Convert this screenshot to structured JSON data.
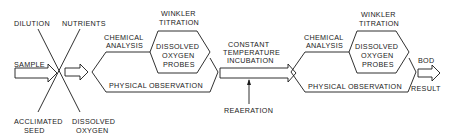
{
  "diagram": {
    "inputs": {
      "top_left": "DILUTION",
      "top_right": "NUTRIENTS",
      "left": "SAMPLE",
      "bottom_left": [
        "ACCLIMATED",
        "SEED"
      ],
      "bottom_right": [
        "DISSOLVED",
        "OXYGEN"
      ]
    },
    "stage1": {
      "chemical_analysis": [
        "CHEMICAL",
        "ANALYSIS"
      ],
      "winkler": [
        "WINKLER",
        "TITRATION"
      ],
      "do_probes": [
        "DISSOLVED",
        "OXYGEN",
        "PROBES"
      ],
      "physical_observation": "PHYSICAL OBSERVATION"
    },
    "incubation": {
      "label": [
        "CONSTANT",
        "TEMPERATURE",
        "INCUBATION"
      ],
      "reaeration": "REAERATION"
    },
    "stage2": {
      "chemical_analysis": [
        "CHEMICAL",
        "ANALYSIS"
      ],
      "winkler": [
        "WINKLER",
        "TITRATION"
      ],
      "do_probes": [
        "DISSOLVED",
        "OXYGEN",
        "PROBES"
      ],
      "physical_observation": "PHYSICAL OBSERVATION"
    },
    "output": {
      "top": "BOD",
      "bottom": "RESULT"
    },
    "colors": {
      "stroke": "#1a1a1a",
      "background": "#ffffff"
    }
  }
}
